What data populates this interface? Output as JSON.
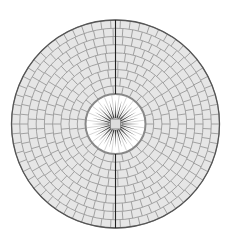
{
  "diagram": {
    "type": "circular-paving-pattern",
    "center": {
      "x": 115.5,
      "y": 124
    },
    "outer_radius": 104,
    "inner_ring_radius": 30,
    "paving_rings": 9,
    "stones_per_ring_base": 22,
    "rose": {
      "spikes": 24,
      "outer_radius": 24,
      "inner_radius": 6,
      "center_square": 5
    },
    "colors": {
      "background": "#ffffff",
      "stone_fill": "#e6e6e6",
      "grout": "#9a9a9a",
      "outer_border": "#555555",
      "inner_ring": "#888888",
      "inner_disc": "#ffffff",
      "rose_spike": "#3d3d3d",
      "rose_ray": "#bbbbbb",
      "axis_line": "#222222"
    }
  }
}
